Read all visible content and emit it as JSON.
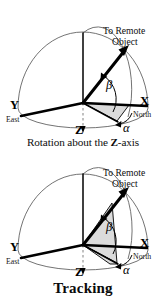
{
  "figure": {
    "title": "Tracking",
    "panels": [
      {
        "id": "rotation-about-z",
        "caption_prefix": "Rotation about the ",
        "caption_bold": "Z",
        "caption_suffix": "-axis",
        "caption_full": "Rotation about the Z-axis",
        "annotations": {
          "callout_line1": "To Remote",
          "callout_line2": "Object",
          "axis_x": "X",
          "axis_x_sub": "North",
          "axis_y": "Y",
          "axis_y_sub": "East",
          "axis_z": "Z",
          "angle_elevation": "β",
          "angle_azimuth": "α"
        }
      },
      {
        "id": "rotation-about-new-y",
        "caption_prefix": "Rotation about the new y-axis",
        "caption_bold": "",
        "caption_suffix": "",
        "caption_full": "Rotation about the new y-axis",
        "annotations": {
          "callout_line1": "To Remote",
          "callout_line2": "Object",
          "axis_x": "X",
          "axis_x_sub": "North",
          "axis_y": "Y",
          "axis_y_sub": "East",
          "axis_z": "Z",
          "angle_elevation": "β",
          "angle_azimuth": "α"
        }
      }
    ]
  },
  "colors": {
    "ink": "#000000",
    "shade_fill": "#d9d9d9",
    "dome_stroke": "#5a5a5a",
    "dashed_stroke": "#8e8e8e",
    "background": "#ffffff"
  }
}
